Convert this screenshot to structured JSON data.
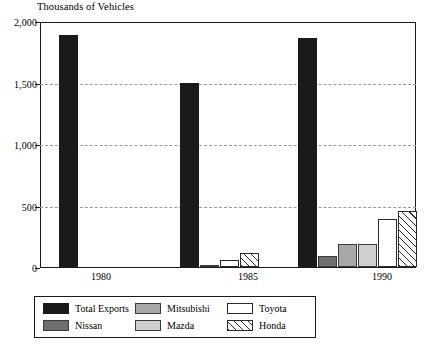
{
  "chart_data": {
    "type": "bar",
    "title": "Thousands of Vehicles",
    "xlabel": "",
    "ylabel": "Thousands of Vehicles",
    "ylim": [
      0,
      2000
    ],
    "yticks": [
      "0",
      "500",
      "1,000",
      "1,500",
      "2,000"
    ],
    "ytick_values": [
      0,
      500,
      1000,
      1500,
      2000
    ],
    "grid": true,
    "legend_position": "bottom-left",
    "categories": [
      "1980",
      "1985",
      "1990"
    ],
    "series": [
      {
        "name": "Total Exports",
        "key": "total",
        "color": "#1a1a1a",
        "values": [
          1900,
          1510,
          1880
        ]
      },
      {
        "name": "Nissan",
        "key": "nissan",
        "color": "#6e6e6e",
        "values": [
          0,
          30,
          105
        ]
      },
      {
        "name": "Mitsubishi",
        "key": "mitsu",
        "color": "#a8a8a8",
        "values": [
          0,
          0,
          200
        ]
      },
      {
        "name": "Mazda",
        "key": "mazda",
        "color": "#cfcfcf",
        "values": [
          0,
          0,
          200
        ]
      },
      {
        "name": "Toyota",
        "key": "toyota",
        "color": "#ffffff",
        "values": [
          0,
          70,
          410
        ]
      },
      {
        "name": "Honda",
        "key": "honda",
        "color": "#ffffff",
        "values": [
          0,
          130,
          470
        ]
      }
    ]
  },
  "legend": {
    "entries": [
      {
        "label": "Total Exports",
        "swatch": "total"
      },
      {
        "label": "Nissan",
        "swatch": "nissan"
      },
      {
        "label": "Mitsubishi",
        "swatch": "mitsu"
      },
      {
        "label": "Mazda",
        "swatch": "mazda"
      },
      {
        "label": "Toyota",
        "swatch": "toyota"
      },
      {
        "label": "Honda",
        "swatch": "honda"
      }
    ]
  }
}
